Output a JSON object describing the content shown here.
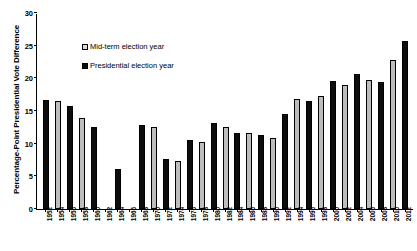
{
  "chart_data": {
    "type": "bar",
    "title": "",
    "xlabel": "",
    "ylabel": "Percentage-Point Presidential Vote Difference",
    "ylim": [
      0,
      30
    ],
    "yticks": [
      0,
      5,
      10,
      15,
      20,
      25,
      30
    ],
    "grid": false,
    "legend_position": "upper-left-inside",
    "legend": [
      {
        "label": "Mid-term election year",
        "color": "#d9d9d9",
        "key": "midterm"
      },
      {
        "label": "Presidential election year",
        "color": "#0d0d0d",
        "key": "presidential"
      }
    ],
    "categories": [
      "1952",
      "1954",
      "1956",
      "1958",
      "1960",
      "1962",
      "1964",
      "1966",
      "1968",
      "1970",
      "1972",
      "1974",
      "1976",
      "1978",
      "1980",
      "1982",
      "1984",
      "1986",
      "1988",
      "1990",
      "1992",
      "1994",
      "1996",
      "1998",
      "2000",
      "2002",
      "2004",
      "2006",
      "2008",
      "2010",
      "2012"
    ],
    "points": [
      {
        "year": "1952",
        "value": 16.7,
        "series": "presidential"
      },
      {
        "year": "1954",
        "value": 16.6,
        "series": "midterm"
      },
      {
        "year": "1956",
        "value": 15.7,
        "series": "presidential"
      },
      {
        "year": "1958",
        "value": 14.0,
        "series": "midterm"
      },
      {
        "year": "1960",
        "value": 12.6,
        "series": "presidential"
      },
      {
        "year": "1962",
        "value": null,
        "series": "midterm"
      },
      {
        "year": "1964",
        "value": 6.2,
        "series": "presidential"
      },
      {
        "year": "1966",
        "value": null,
        "series": "midterm"
      },
      {
        "year": "1968",
        "value": 12.9,
        "series": "presidential"
      },
      {
        "year": "1970",
        "value": 12.5,
        "series": "midterm"
      },
      {
        "year": "1972",
        "value": 7.6,
        "series": "presidential"
      },
      {
        "year": "1974",
        "value": 7.3,
        "series": "midterm"
      },
      {
        "year": "1976",
        "value": 10.6,
        "series": "presidential"
      },
      {
        "year": "1978",
        "value": 10.3,
        "series": "midterm"
      },
      {
        "year": "1980",
        "value": 13.1,
        "series": "presidential"
      },
      {
        "year": "1982",
        "value": 12.6,
        "series": "midterm"
      },
      {
        "year": "1984",
        "value": 11.6,
        "series": "presidential"
      },
      {
        "year": "1986",
        "value": 11.6,
        "series": "midterm"
      },
      {
        "year": "1988",
        "value": 11.4,
        "series": "presidential"
      },
      {
        "year": "1990",
        "value": 10.9,
        "series": "midterm"
      },
      {
        "year": "1992",
        "value": 14.6,
        "series": "presidential"
      },
      {
        "year": "1994",
        "value": 16.9,
        "series": "midterm"
      },
      {
        "year": "1996",
        "value": 16.6,
        "series": "presidential"
      },
      {
        "year": "1998",
        "value": 17.3,
        "series": "midterm"
      },
      {
        "year": "2000",
        "value": 19.6,
        "series": "presidential"
      },
      {
        "year": "2002",
        "value": 19.0,
        "series": "midterm"
      },
      {
        "year": "2004",
        "value": 20.6,
        "series": "presidential"
      },
      {
        "year": "2006",
        "value": 19.8,
        "series": "midterm"
      },
      {
        "year": "2008",
        "value": 19.4,
        "series": "presidential"
      },
      {
        "year": "2010",
        "value": 22.8,
        "series": "midterm"
      },
      {
        "year": "2012",
        "value": 25.7,
        "series": "presidential"
      }
    ]
  }
}
